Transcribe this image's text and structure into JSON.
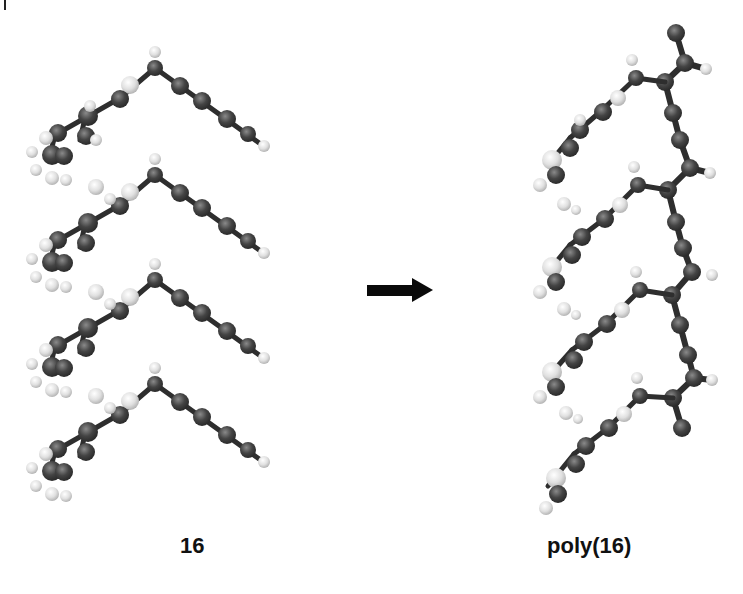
{
  "figure": {
    "reaction_arrow": "right-arrow",
    "left": {
      "label": "16",
      "description": "stacked monomer units (4)",
      "units": 4
    },
    "right": {
      "label": "poly(16)",
      "description": "polymer chain with pendant groups",
      "units": 4
    },
    "colors": {
      "carbon": "#3a3a3a",
      "hydrogen": "#d8d8d8",
      "bond": "#2e2e2e",
      "arrow": "#0a0a0a",
      "background": "#ffffff"
    }
  }
}
